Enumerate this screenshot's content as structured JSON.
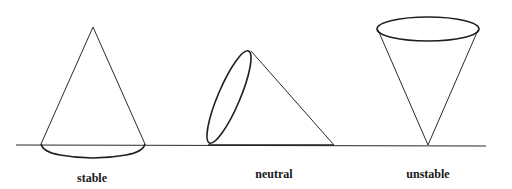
{
  "diagram": {
    "ground": {
      "x1": 16,
      "y1": 145,
      "x2": 486,
      "y2": 146
    },
    "cones": [
      {
        "label": "stable",
        "apex": [
          93,
          27
        ],
        "base_left": [
          41,
          144
        ],
        "base_right": [
          145,
          144
        ],
        "label_pos": [
          92,
          182
        ]
      },
      {
        "label": "neutral",
        "apex": [
          334,
          145
        ],
        "ellipse_top": [
          250,
          49
        ],
        "ellipse_bottom": [
          208,
          145
        ],
        "label_pos": [
          274,
          178
        ]
      },
      {
        "label": "unstable",
        "apex": [
          428,
          145
        ],
        "ellipse_center": [
          428,
          29
        ],
        "ellipse_rx": 51,
        "ellipse_ry": 12,
        "label_pos": [
          428,
          178
        ]
      }
    ],
    "colors": {
      "line": "#2a2a2a",
      "background": "#ffffff",
      "text": "#1a1a1a"
    }
  }
}
